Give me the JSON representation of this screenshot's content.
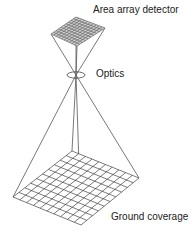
{
  "labels": {
    "detector": "Area array detector",
    "optics": "Optics",
    "ground": "Ground coverage"
  },
  "geometry": {
    "detector_corners": [
      [
        51,
        34
      ],
      [
        76,
        17
      ],
      [
        105,
        28
      ],
      [
        77,
        46
      ]
    ],
    "focal_point": [
      76,
      75
    ],
    "ground_corners": [
      [
        13,
        197
      ],
      [
        72,
        151
      ],
      [
        139,
        178
      ],
      [
        81,
        225
      ]
    ],
    "detector_grid": 10,
    "ground_grid": 10
  },
  "colors": {
    "line": "#444444",
    "detector_fill": "#999999"
  }
}
